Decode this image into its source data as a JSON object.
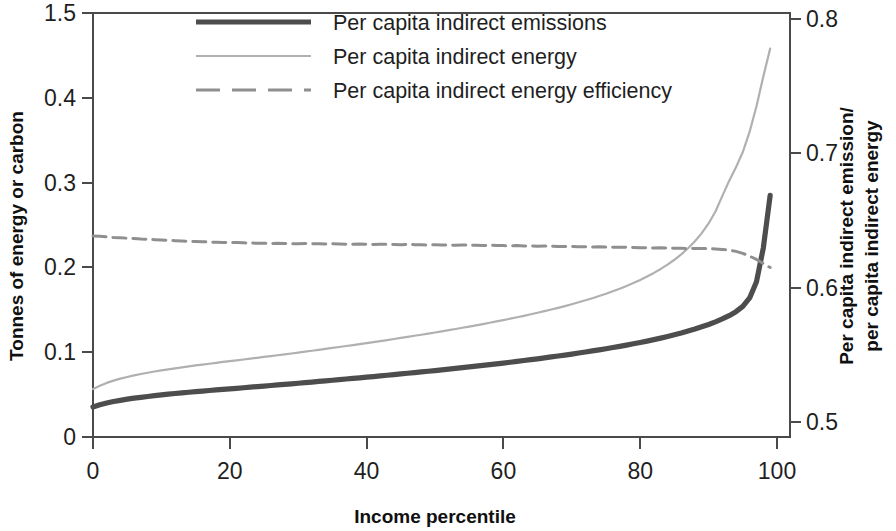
{
  "chart_data": {
    "type": "line",
    "title": "",
    "xlabel": "Income percentile",
    "ylabel": "Tonnes of energy or carbon",
    "ylabel_right": "Per capita indirect emission/ per capita indirect energy",
    "grid": false,
    "legend_position": "top-center",
    "xlim": [
      0,
      100
    ],
    "xticks": [
      0,
      20,
      40,
      60,
      80,
      100
    ],
    "xticklabels": [
      "0",
      "20",
      "40",
      "60",
      "80",
      "100"
    ],
    "ylim": [
      0,
      0.5
    ],
    "yticks": [
      0,
      0.1,
      0.2,
      0.3,
      0.4,
      0.5
    ],
    "yticklabels": [
      "0",
      "0.1",
      "0.2",
      "0.3",
      "0.4",
      "1.5"
    ],
    "ylim_right": [
      0.5,
      0.8
    ],
    "yticks_right": [
      0.5,
      0.6,
      0.7,
      0.8
    ],
    "yticklabels_right": [
      "0.5",
      "0.6",
      "0.7",
      "0.8"
    ],
    "colors": {
      "emissions": "#4d4d4d",
      "energy": "#b0b0b0",
      "efficiency": "#8f8f8f",
      "axis": "#4a4a4a",
      "text": "#1f1f1f",
      "background": "#ffffff"
    },
    "series": [
      {
        "name": "Per capita indirect emissions",
        "label": "Per capita indirect emissions",
        "axis": "left",
        "style": "solid",
        "width": 5.2,
        "color": "#4d4d4d",
        "x": [
          0,
          1,
          2,
          3,
          4,
          5,
          6,
          7,
          8,
          9,
          10,
          11,
          12,
          13,
          14,
          15,
          16,
          17,
          18,
          19,
          20,
          21,
          22,
          23,
          24,
          25,
          26,
          27,
          28,
          29,
          30,
          31,
          32,
          33,
          34,
          35,
          36,
          37,
          38,
          39,
          40,
          41,
          42,
          43,
          44,
          45,
          46,
          47,
          48,
          49,
          50,
          51,
          52,
          53,
          54,
          55,
          56,
          57,
          58,
          59,
          60,
          61,
          62,
          63,
          64,
          65,
          66,
          67,
          68,
          69,
          70,
          71,
          72,
          73,
          74,
          75,
          76,
          77,
          78,
          79,
          80,
          81,
          82,
          83,
          84,
          85,
          86,
          87,
          88,
          89,
          90,
          91,
          92,
          93,
          94,
          95,
          96,
          97,
          98,
          99
        ],
        "values": [
          0.0355,
          0.038,
          0.04,
          0.0418,
          0.0432,
          0.0446,
          0.0458,
          0.0468,
          0.0478,
          0.0488,
          0.0497,
          0.0505,
          0.0513,
          0.0521,
          0.0528,
          0.0535,
          0.0541,
          0.0548,
          0.0556,
          0.0562,
          0.0568,
          0.0574,
          0.0581,
          0.0588,
          0.0594,
          0.06,
          0.0607,
          0.0614,
          0.062,
          0.0627,
          0.0634,
          0.0641,
          0.0648,
          0.0655,
          0.0662,
          0.0669,
          0.0676,
          0.0684,
          0.0691,
          0.0698,
          0.0706,
          0.0713,
          0.072,
          0.0728,
          0.0736,
          0.0744,
          0.0752,
          0.076,
          0.0767,
          0.0775,
          0.0783,
          0.0791,
          0.08,
          0.0809,
          0.0818,
          0.0827,
          0.0836,
          0.0845,
          0.0854,
          0.0863,
          0.0872,
          0.0882,
          0.0892,
          0.0902,
          0.0912,
          0.0922,
          0.0933,
          0.0944,
          0.0955,
          0.0966,
          0.0978,
          0.099,
          0.1002,
          0.1015,
          0.1028,
          0.1041,
          0.1055,
          0.1069,
          0.1084,
          0.1099,
          0.1115,
          0.1131,
          0.1148,
          0.1166,
          0.1185,
          0.1205,
          0.1226,
          0.1249,
          0.1273,
          0.1299,
          0.1327,
          0.1358,
          0.1392,
          0.1431,
          0.1478,
          0.154,
          0.164,
          0.183,
          0.223,
          0.285
        ]
      },
      {
        "name": "Per capita indirect energy",
        "label": "Per capita indirect energy",
        "axis": "left",
        "style": "solid",
        "width": 2.2,
        "color": "#b0b0b0",
        "x": [
          0,
          1,
          2,
          3,
          4,
          5,
          6,
          7,
          8,
          9,
          10,
          11,
          12,
          13,
          14,
          15,
          16,
          17,
          18,
          19,
          20,
          21,
          22,
          23,
          24,
          25,
          26,
          27,
          28,
          29,
          30,
          31,
          32,
          33,
          34,
          35,
          36,
          37,
          38,
          39,
          40,
          41,
          42,
          43,
          44,
          45,
          46,
          47,
          48,
          49,
          50,
          51,
          52,
          53,
          54,
          55,
          56,
          57,
          58,
          59,
          60,
          61,
          62,
          63,
          64,
          65,
          66,
          67,
          68,
          69,
          70,
          71,
          72,
          73,
          74,
          75,
          76,
          77,
          78,
          79,
          80,
          81,
          82,
          83,
          84,
          85,
          86,
          87,
          88,
          89,
          90,
          91,
          92,
          93,
          94,
          95,
          96,
          97,
          98,
          99
        ],
        "values": [
          0.0565,
          0.0605,
          0.0638,
          0.0665,
          0.0688,
          0.0708,
          0.0727,
          0.0743,
          0.0758,
          0.0772,
          0.0786,
          0.0798,
          0.081,
          0.0822,
          0.0833,
          0.0844,
          0.0854,
          0.0864,
          0.0875,
          0.0885,
          0.0894,
          0.0904,
          0.0914,
          0.0924,
          0.0934,
          0.0944,
          0.0954,
          0.0964,
          0.0974,
          0.0985,
          0.0995,
          0.1006,
          0.1017,
          0.1028,
          0.1039,
          0.105,
          0.1061,
          0.1073,
          0.1084,
          0.1096,
          0.1108,
          0.1119,
          0.1131,
          0.1143,
          0.1156,
          0.1168,
          0.1181,
          0.1194,
          0.1206,
          0.1219,
          0.1232,
          0.1246,
          0.126,
          0.1274,
          0.1288,
          0.1302,
          0.1317,
          0.1332,
          0.1347,
          0.1363,
          0.1379,
          0.1395,
          0.1412,
          0.1429,
          0.1447,
          0.1465,
          0.1484,
          0.1503,
          0.1523,
          0.1544,
          0.1566,
          0.1589,
          0.1612,
          0.1637,
          0.1663,
          0.169,
          0.1719,
          0.1749,
          0.1781,
          0.1815,
          0.1852,
          0.1892,
          0.1935,
          0.1982,
          0.2033,
          0.209,
          0.2154,
          0.2226,
          0.2308,
          0.2404,
          0.2518,
          0.266,
          0.284,
          0.302,
          0.318,
          0.336,
          0.36,
          0.39,
          0.425,
          0.458
        ]
      },
      {
        "name": "Per capita indirect energy efficiency",
        "label": "Per capita indirect energy efficiency",
        "axis": "right",
        "style": "dashed",
        "width": 3.0,
        "color": "#8f8f8f",
        "x": [
          0,
          1,
          2,
          3,
          4,
          5,
          6,
          7,
          8,
          9,
          10,
          11,
          12,
          13,
          14,
          15,
          16,
          17,
          18,
          19,
          20,
          21,
          22,
          23,
          24,
          25,
          26,
          27,
          28,
          29,
          30,
          31,
          32,
          33,
          34,
          35,
          36,
          37,
          38,
          39,
          40,
          41,
          42,
          43,
          44,
          45,
          46,
          47,
          48,
          49,
          50,
          51,
          52,
          53,
          54,
          55,
          56,
          57,
          58,
          59,
          60,
          61,
          62,
          63,
          64,
          65,
          66,
          67,
          68,
          69,
          70,
          71,
          72,
          73,
          74,
          75,
          76,
          77,
          78,
          79,
          80,
          81,
          82,
          83,
          84,
          85,
          86,
          87,
          88,
          89,
          90,
          91,
          92,
          93,
          94,
          95,
          96,
          97,
          98,
          99
        ],
        "values": [
          0.6385,
          0.6382,
          0.6378,
          0.6374,
          0.6372,
          0.6368,
          0.6366,
          0.6362,
          0.636,
          0.6357,
          0.6355,
          0.6352,
          0.635,
          0.6348,
          0.6345,
          0.6344,
          0.6342,
          0.634,
          0.6338,
          0.6337,
          0.6335,
          0.6336,
          0.6334,
          0.6332,
          0.6331,
          0.633,
          0.6329,
          0.6331,
          0.6329,
          0.6328,
          0.6327,
          0.6329,
          0.6327,
          0.6326,
          0.6325,
          0.6327,
          0.6325,
          0.6324,
          0.6323,
          0.6325,
          0.6323,
          0.6322,
          0.6324,
          0.6322,
          0.6321,
          0.632,
          0.6322,
          0.632,
          0.6319,
          0.6318,
          0.632,
          0.6318,
          0.6317,
          0.6316,
          0.6318,
          0.6316,
          0.6315,
          0.6314,
          0.6316,
          0.6314,
          0.6313,
          0.6312,
          0.6313,
          0.6311,
          0.631,
          0.6309,
          0.631,
          0.6308,
          0.6307,
          0.6306,
          0.6307,
          0.6305,
          0.6304,
          0.6303,
          0.6304,
          0.6302,
          0.6301,
          0.63,
          0.6301,
          0.6299,
          0.6298,
          0.6297,
          0.6296,
          0.6297,
          0.6295,
          0.6294,
          0.6293,
          0.6292,
          0.6291,
          0.6292,
          0.629,
          0.6288,
          0.6285,
          0.628,
          0.627,
          0.6255,
          0.6235,
          0.621,
          0.618,
          0.615
        ]
      }
    ]
  },
  "axes": {
    "left_title": "Tonnes of energy or carbon",
    "right_title_line1": "Per capita indirect emission/",
    "right_title_line2": "per capita indirect energy",
    "bottom_title": "Income percentile"
  },
  "legend": {
    "items": [
      {
        "label": "Per capita indirect emissions",
        "swatch": "thick-solid-line-icon"
      },
      {
        "label": "Per capita indirect energy",
        "swatch": "thin-solid-line-icon"
      },
      {
        "label": "Per capita indirect energy efficiency",
        "swatch": "dashed-line-icon"
      }
    ]
  }
}
